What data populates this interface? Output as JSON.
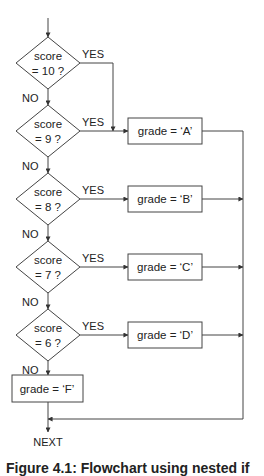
{
  "diagram": {
    "type": "flowchart",
    "entry_label": "",
    "decisions": [
      {
        "line1": "score",
        "line2": "= 10 ?",
        "yes_label": "YES",
        "no_label": "NO",
        "yes_target": "grade = 'A'"
      },
      {
        "line1": "score",
        "line2": "= 9 ?",
        "yes_label": "YES",
        "no_label": "NO",
        "yes_target": "grade = 'A'"
      },
      {
        "line1": "score",
        "line2": "= 8 ?",
        "yes_label": "YES",
        "no_label": "NO",
        "yes_target": "grade = 'B'"
      },
      {
        "line1": "score",
        "line2": "= 7 ?",
        "yes_label": "YES",
        "no_label": "NO",
        "yes_target": "grade = 'C'"
      },
      {
        "line1": "score",
        "line2": "= 6 ?",
        "yes_label": "YES",
        "no_label": "NO",
        "yes_target": "grade = 'D'"
      }
    ],
    "process_boxes": [
      {
        "id": "A",
        "text": "grade = ‘A’"
      },
      {
        "id": "B",
        "text": "grade = ‘B’"
      },
      {
        "id": "C",
        "text": "grade = ‘C’"
      },
      {
        "id": "D",
        "text": "grade = ‘D’"
      },
      {
        "id": "F",
        "text": "grade = ‘F’"
      }
    ],
    "exit_label": "NEXT",
    "line_color": "#444444"
  },
  "caption": "Figure 4.1: Flowchart using nested if"
}
